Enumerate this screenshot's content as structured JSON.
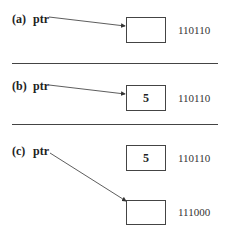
{
  "panels": [
    {
      "label": "(a)",
      "pointer": "ptr",
      "boxes": [
        {
          "value": "",
          "address": "110110"
        }
      ]
    },
    {
      "label": "(b)",
      "pointer": "ptr",
      "boxes": [
        {
          "value": "5",
          "address": "110110"
        }
      ]
    },
    {
      "label": "(c)",
      "pointer": "ptr",
      "boxes": [
        {
          "value": "5",
          "address": "110110"
        },
        {
          "value": "",
          "address": "111000"
        }
      ]
    }
  ]
}
